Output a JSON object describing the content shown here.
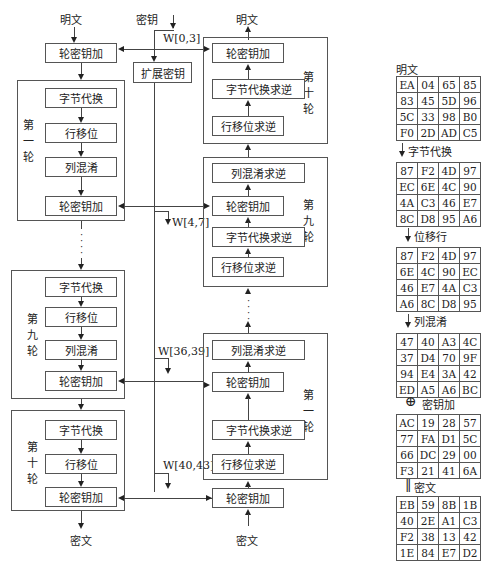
{
  "encrypt": {
    "input_label": "明文",
    "output_label": "密文",
    "initial_add_round_key": "轮密钥加",
    "round1": {
      "label": "第一轮",
      "steps": [
        "字节代换",
        "行移位",
        "列混淆",
        "轮密钥加"
      ]
    },
    "round9": {
      "label": "第九轮",
      "steps": [
        "字节代换",
        "行移位",
        "列混淆",
        "轮密钥加"
      ]
    },
    "round10": {
      "label": "第十轮",
      "steps": [
        "字节代换",
        "行移位",
        "轮密钥加"
      ]
    }
  },
  "key": {
    "input_label": "密钥",
    "expand_label": "扩展密钥",
    "words": [
      "W[0,3]",
      "W[4,7]",
      "W[36,39]",
      "W[40,43]"
    ]
  },
  "decrypt": {
    "input_label": "密文",
    "output_label": "明文",
    "initial_add_round_key": "轮密钥加",
    "round10": {
      "label": "第十轮",
      "steps": [
        "轮密钥加",
        "字节代换求逆",
        "行移位求逆"
      ]
    },
    "round9": {
      "label": "第九轮",
      "steps": [
        "列混淆求逆",
        "轮密钥加",
        "字节代换求逆",
        "行移位求逆"
      ]
    },
    "round1": {
      "label": "第一轮",
      "steps": [
        "列混淆求逆",
        "轮密钥加",
        "字节代换求逆",
        "行移位求逆"
      ]
    }
  },
  "example": {
    "plaintext_label": "明文",
    "plaintext": [
      [
        "EA",
        "04",
        "65",
        "85"
      ],
      [
        "83",
        "45",
        "5D",
        "96"
      ],
      [
        "5C",
        "33",
        "98",
        "B0"
      ],
      [
        "F0",
        "2D",
        "AD",
        "C5"
      ]
    ],
    "subbytes_label": "字节代换",
    "subbytes": [
      [
        "87",
        "F2",
        "4D",
        "97"
      ],
      [
        "EC",
        "6E",
        "4C",
        "90"
      ],
      [
        "4A",
        "C3",
        "46",
        "E7"
      ],
      [
        "8C",
        "D8",
        "95",
        "A6"
      ]
    ],
    "shiftrows_label": "位移行",
    "shiftrows": [
      [
        "87",
        "F2",
        "4D",
        "97"
      ],
      [
        "6E",
        "4C",
        "90",
        "EC"
      ],
      [
        "46",
        "E7",
        "4A",
        "C3"
      ],
      [
        "A6",
        "8C",
        "D8",
        "95"
      ]
    ],
    "mixcolumns_label": "列混淆",
    "mixcolumns": [
      [
        "47",
        "40",
        "A3",
        "4C"
      ],
      [
        "37",
        "D4",
        "70",
        "9F"
      ],
      [
        "94",
        "E4",
        "3A",
        "42"
      ],
      [
        "ED",
        "A5",
        "A6",
        "BC"
      ]
    ],
    "addkey_symbol": "⊕",
    "addkey_label": "密钥加",
    "roundkey": [
      [
        "AC",
        "19",
        "28",
        "57"
      ],
      [
        "77",
        "FA",
        "D1",
        "5C"
      ],
      [
        "66",
        "DC",
        "29",
        "00"
      ],
      [
        "F3",
        "21",
        "41",
        "6A"
      ]
    ],
    "equals_symbol": "‖",
    "ciphertext_label": "密文",
    "ciphertext": [
      [
        "EB",
        "59",
        "8B",
        "1B"
      ],
      [
        "40",
        "2E",
        "A1",
        "C3"
      ],
      [
        "F2",
        "38",
        "13",
        "42"
      ],
      [
        "1E",
        "84",
        "E7",
        "D2"
      ]
    ]
  }
}
